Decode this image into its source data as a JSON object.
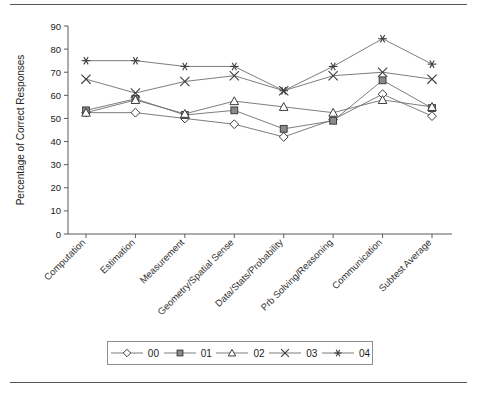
{
  "chart_data": {
    "type": "line",
    "title": "",
    "xlabel": "",
    "ylabel": "Percentage of Correct Responses",
    "ylim": [
      0,
      90
    ],
    "yticks": [
      0,
      10,
      20,
      30,
      40,
      50,
      60,
      70,
      80,
      90
    ],
    "grid": false,
    "legend_position": "bottom",
    "categories": [
      "Computation",
      "Estimation",
      "Measurement",
      "Geometry/Spatial Sense",
      "Data/Stats/Probability",
      "Prb Solving/Reasoning",
      "Communication",
      "Subtest Average"
    ],
    "series": [
      {
        "name": "00",
        "marker": "diamond-open",
        "values": [
          52.5,
          52.5,
          50,
          47.5,
          42,
          49.5,
          60.5,
          51
        ]
      },
      {
        "name": "01",
        "marker": "square-filled",
        "values": [
          53.5,
          58.5,
          51.5,
          53.5,
          45.5,
          49,
          66.5,
          54.5
        ]
      },
      {
        "name": "02",
        "marker": "triangle-open",
        "values": [
          52.5,
          58,
          52,
          57.5,
          55,
          52.5,
          58,
          55
        ]
      },
      {
        "name": "03",
        "marker": "cross-x",
        "values": [
          67,
          61,
          66,
          68.5,
          62,
          68.5,
          70,
          67
        ]
      },
      {
        "name": "04",
        "marker": "asterisk",
        "values": [
          75,
          75,
          72.5,
          72.5,
          62,
          72.5,
          84.5,
          73.5
        ]
      }
    ]
  },
  "legend": {
    "entries": [
      {
        "label": "00",
        "marker": "diamond-open"
      },
      {
        "label": "01",
        "marker": "square-filled"
      },
      {
        "label": "02",
        "marker": "triangle-open"
      },
      {
        "label": "03",
        "marker": "cross-x"
      },
      {
        "label": "04",
        "marker": "asterisk"
      }
    ]
  },
  "colors": {
    "line": "#6e6e6e",
    "marker_stroke": "#3d3d3d",
    "marker_fill": "#8a8a8a",
    "axis": "#5a5a5a",
    "text": "#222222",
    "background": "#ffffff"
  }
}
